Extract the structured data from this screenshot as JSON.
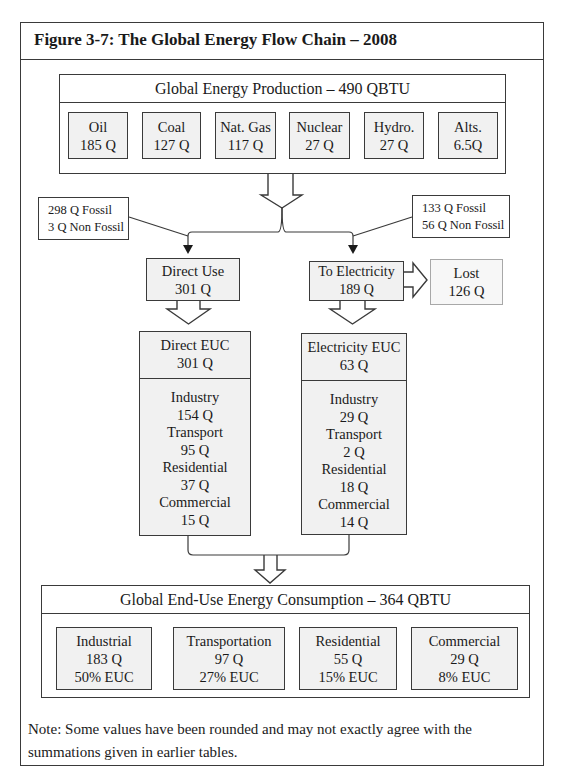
{
  "figure": {
    "title": "Figure 3-7:  The Global Energy Flow Chain – 2008",
    "note_line1": "Note:  Some values have been rounded and may not exactly agree with the",
    "note_line2": "summations given in earlier tables."
  },
  "production": {
    "header": "Global Energy Production – 490 QBTU",
    "sources": [
      {
        "name": "Oil",
        "value": "185 Q"
      },
      {
        "name": "Coal",
        "value": "127 Q"
      },
      {
        "name": "Nat. Gas",
        "value": "117 Q"
      },
      {
        "name": "Nuclear",
        "value": "27 Q"
      },
      {
        "name": "Hydro.",
        "value": "27 Q"
      },
      {
        "name": "Alts.",
        "value": "6.5Q"
      }
    ]
  },
  "split_notes": {
    "direct": {
      "line1": "298 Q Fossil",
      "line2": "3 Q Non Fossil"
    },
    "electricity": {
      "line1": "133 Q Fossil",
      "line2": "56 Q Non Fossil"
    }
  },
  "flows": {
    "direct_use": {
      "label": "Direct Use",
      "value": "301 Q"
    },
    "to_electricity": {
      "label": "To Electricity",
      "value": "189 Q"
    },
    "lost": {
      "label": "Lost",
      "value": "126 Q"
    }
  },
  "euc": {
    "direct": {
      "label": "Direct EUC",
      "value": "301 Q",
      "sectors": [
        {
          "name": "Industry",
          "value": "154 Q"
        },
        {
          "name": "Transport",
          "value": "95 Q"
        },
        {
          "name": "Residential",
          "value": "37 Q"
        },
        {
          "name": "Commercial",
          "value": "15 Q"
        }
      ]
    },
    "electricity": {
      "label": "Electricity EUC",
      "value": "63 Q",
      "sectors": [
        {
          "name": "Industry",
          "value": "29 Q"
        },
        {
          "name": "Transport",
          "value": "2 Q"
        },
        {
          "name": "Residential",
          "value": "18 Q"
        },
        {
          "name": "Commercial",
          "value": "14 Q"
        }
      ]
    }
  },
  "end_use": {
    "header": "Global End-Use Energy Consumption – 364 QBTU",
    "sectors": [
      {
        "name": "Industrial",
        "value": "183 Q",
        "share": "50% EUC"
      },
      {
        "name": "Transportation",
        "value": "97 Q",
        "share": "27% EUC"
      },
      {
        "name": "Residential",
        "value": "55 Q",
        "share": "15% EUC"
      },
      {
        "name": "Commercial",
        "value": "29 Q",
        "share": "8% EUC"
      }
    ]
  },
  "colors": {
    "stroke": "#3a3a3a",
    "box_fill": "#f1f1f1",
    "lost_border": "#a8a8a8"
  }
}
